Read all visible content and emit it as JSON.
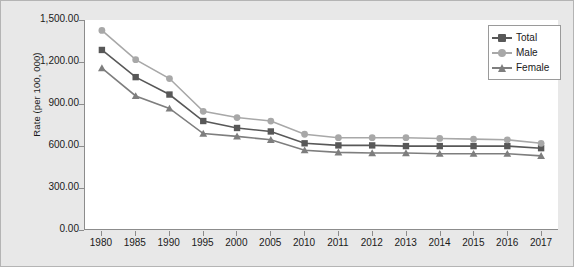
{
  "chart_data": {
    "type": "line",
    "title": "",
    "subtitle": "",
    "xlabel": "",
    "ylabel": "Rate (per 100, 000)",
    "ylim": [
      0,
      1500
    ],
    "ytick_step": 300,
    "ytick_labels": [
      "1,500.00",
      "1,200.00",
      "900.00",
      "600.00",
      "300.00",
      "0.00"
    ],
    "ytick_values": [
      1500,
      1200,
      900,
      600,
      300,
      0
    ],
    "grid": false,
    "legend_position": "top-right",
    "categories": [
      "1980",
      "1985",
      "1990",
      "1995",
      "2000",
      "2005",
      "2010",
      "2011",
      "2012",
      "2013",
      "2014",
      "2015",
      "2016",
      "2017"
    ],
    "series": [
      {
        "name": "Total",
        "marker": "square",
        "color": "#585858",
        "values": [
          1285,
          1090,
          965,
          775,
          725,
          700,
          615,
          600,
          600,
          595,
          595,
          595,
          595,
          580
        ]
      },
      {
        "name": "Male",
        "marker": "circle",
        "color": "#a8a8a8",
        "values": [
          1425,
          1215,
          1080,
          845,
          800,
          775,
          680,
          655,
          655,
          655,
          650,
          645,
          640,
          615
        ]
      },
      {
        "name": "Female",
        "marker": "triangle",
        "color": "#7e7e7e",
        "values": [
          1155,
          955,
          865,
          685,
          665,
          640,
          565,
          550,
          545,
          545,
          540,
          540,
          540,
          525
        ]
      }
    ]
  },
  "legend": {
    "items": [
      {
        "label": "Total"
      },
      {
        "label": "Male"
      },
      {
        "label": "Female"
      }
    ]
  },
  "colors": {
    "figure_background": "#e8e8e8",
    "plot_background": "#ffffff",
    "axis": "#8c8c8c",
    "text": "#1a1a1a"
  }
}
